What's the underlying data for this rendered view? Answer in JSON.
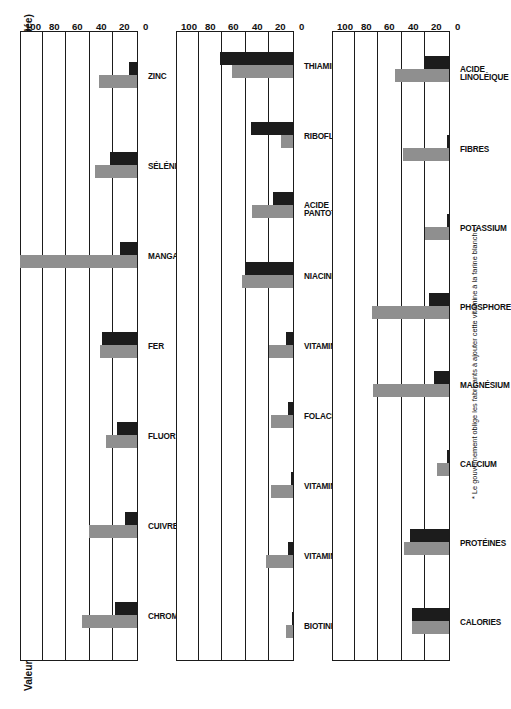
{
  "figure": {
    "title": "Valeurs comparées du blé et de la farine blanche (pour une consommation moyenne, en pourcentage de la ration quotidienne recommandée)",
    "footnote": "* Le gouvernement oblige les fabricants à ajouter cette vitamine à la farine blanche.",
    "legend": {
      "farine_label": "farine blanche",
      "ble_label": "blé",
      "farine_color": "#1c1c1c",
      "ble_color": "#8f8f8f"
    }
  },
  "chart_data": [
    {
      "type": "bar",
      "panel": "mineraux",
      "title": "",
      "xlabel": "",
      "ylabel": "pourcentage de la ration quotidienne recommandée",
      "ylim": [
        0,
        100
      ],
      "yticks": [
        0,
        20,
        40,
        60,
        80,
        100
      ],
      "grid": true,
      "legend_position": "right",
      "categories": [
        "CHROME",
        "CUIVRE",
        "FLUOR",
        "FER",
        "MANGANÈSE",
        "SÉLÉNIUM",
        "ZINC"
      ],
      "series": [
        {
          "name": "blé",
          "values": [
            47,
            41,
            26,
            31,
            99,
            36,
            32
          ]
        },
        {
          "name": "farine blanche",
          "values": [
            19,
            10,
            17,
            30,
            14,
            23,
            7
          ]
        }
      ]
    },
    {
      "type": "bar",
      "panel": "vitamines",
      "title": "",
      "xlabel": "",
      "ylabel": "pourcentage de la ration quotidienne recommandée",
      "ylim": [
        0,
        100
      ],
      "yticks": [
        0,
        20,
        40,
        60,
        80,
        100
      ],
      "grid": true,
      "legend_position": "right",
      "categories": [
        "BIOTINE",
        "VITAMINE B₆",
        "VITAMINE E",
        "FOLACINE",
        "VITAMINE K",
        "NIACINE*",
        "ACIDE PANTOTHÉNIQUE",
        "RIBOFLAVINE*",
        "THIAMINE*"
      ],
      "series": [
        {
          "name": "blé",
          "values": [
            6,
            23,
            19,
            19,
            20,
            43,
            35,
            10,
            52
          ]
        },
        {
          "name": "farine blanche",
          "values": [
            1,
            4,
            2,
            4,
            6,
            41,
            17,
            36,
            62
          ]
        }
      ]
    },
    {
      "type": "bar",
      "panel": "nutriments",
      "title": "",
      "xlabel": "",
      "ylabel": "pourcentage de la ration quotidienne recommandée",
      "ylim": [
        0,
        100
      ],
      "yticks": [
        0,
        20,
        40,
        60,
        80,
        100
      ],
      "grid": true,
      "legend_position": "right",
      "categories": [
        "CALORIES",
        "PROTÉINES",
        "CALCIUM",
        "MAGNÉSIUM",
        "PHOSPHORE",
        "POTASSIUM",
        "FIBRES",
        "ACIDE LINOLÉIQUE"
      ],
      "series": [
        {
          "name": "blé",
          "values": [
            31,
            38,
            10,
            64,
            65,
            20,
            39,
            46
          ]
        },
        {
          "name": "farine blanche",
          "values": [
            31,
            33,
            2,
            13,
            17,
            2,
            2,
            21
          ]
        }
      ]
    }
  ]
}
